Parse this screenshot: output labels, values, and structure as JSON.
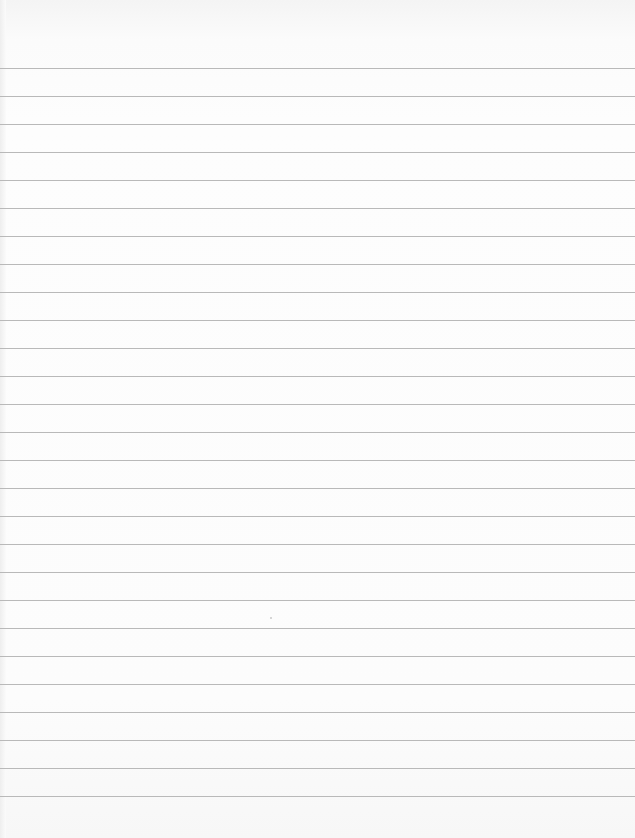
{
  "document": {
    "type": "blank lined paper",
    "line_color": "#b9b9b9",
    "background_color": "#fcfcfc",
    "first_line_y": 68,
    "line_spacing": 28,
    "line_count": 27,
    "text": ""
  }
}
